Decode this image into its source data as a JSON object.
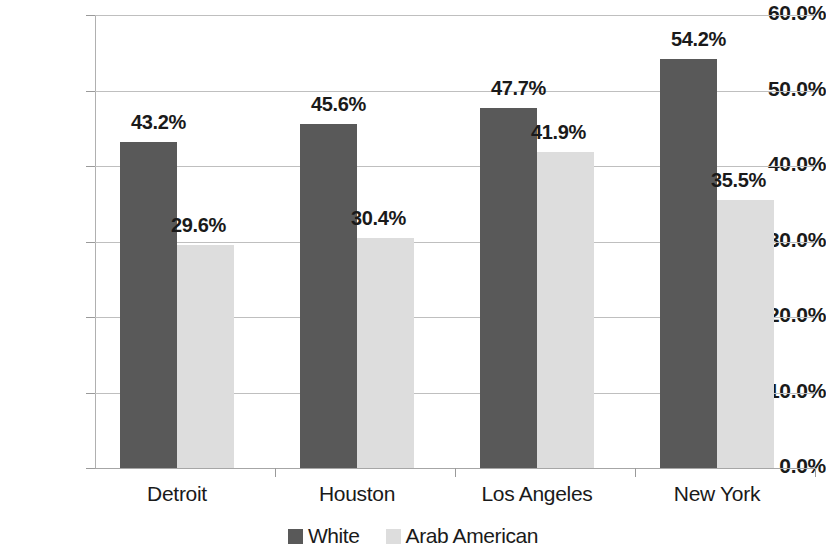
{
  "chart_data": {
    "type": "bar",
    "title": "",
    "subtitle": "",
    "xlabel": "",
    "ylabel": "",
    "ylim": [
      0,
      60
    ],
    "y_tick_labels": [
      "0.0%",
      "10.0%",
      "20.0%",
      "30.0%",
      "40.0%",
      "50.0%",
      "60.0%"
    ],
    "y_tick_values": [
      0,
      10,
      20,
      30,
      40,
      50,
      60
    ],
    "grid": true,
    "legend_position": "bottom-center",
    "categories": [
      "Detroit",
      "Houston",
      "Los Angeles",
      "New York"
    ],
    "series": [
      {
        "name": "White",
        "color": "#595959",
        "values": [
          43.2,
          45.6,
          47.7,
          54.2
        ],
        "labels": [
          "43.2%",
          "45.6%",
          "47.7%",
          "54.2%"
        ]
      },
      {
        "name": "Arab American",
        "color": "#dddddd",
        "values": [
          29.6,
          30.4,
          41.9,
          35.5
        ],
        "labels": [
          "29.6%",
          "30.4%",
          "41.9%",
          "35.5%"
        ]
      }
    ]
  },
  "legend": {
    "items": [
      {
        "label": "White",
        "swatch": "series-white"
      },
      {
        "label": "Arab American",
        "swatch": "series-arab"
      }
    ]
  }
}
